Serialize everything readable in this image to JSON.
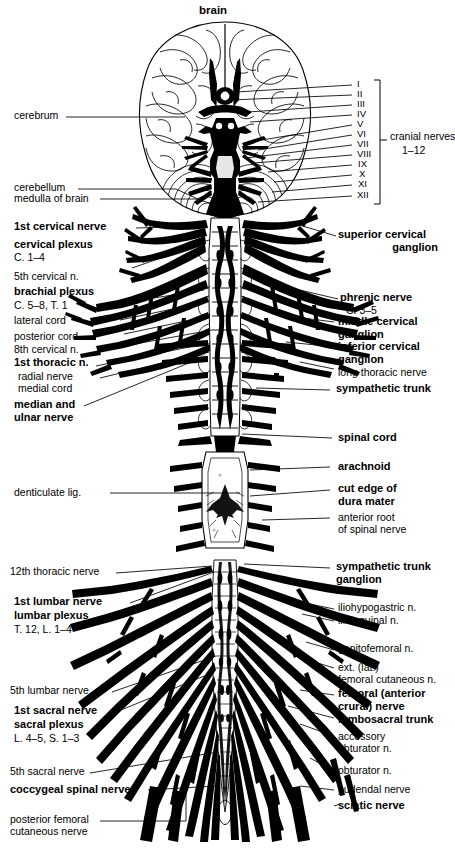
{
  "figure": {
    "title": "brain",
    "type": "anatomical-diagram",
    "cranial_nerve_bracket": {
      "label_line1": "cranial nerves",
      "label_line2": "1–12",
      "numerals": [
        "I",
        "II",
        "III",
        "IV",
        "V",
        "VI",
        "VII",
        "VIII",
        "IX",
        "X",
        "XI",
        "XII"
      ]
    }
  },
  "labels_left": [
    {
      "id": "cerebrum",
      "text": "cerebrum",
      "weight": "regular"
    },
    {
      "id": "cerebellum",
      "text": "cerebellum",
      "weight": "regular"
    },
    {
      "id": "medulla-of-brain",
      "text": "medulla of brain",
      "weight": "regular"
    },
    {
      "id": "first-cervical-nerve",
      "text": "1st cervical nerve",
      "weight": "bold"
    },
    {
      "id": "cervical-plexus",
      "text": "cervical plexus",
      "weight": "bold"
    },
    {
      "id": "cervical-plexus-roots",
      "text": "C. 1–4",
      "weight": "regular"
    },
    {
      "id": "fifth-cervical-n",
      "text": "5th cervical n.",
      "weight": "regular"
    },
    {
      "id": "brachial-plexus",
      "text": "brachial plexus",
      "weight": "bold"
    },
    {
      "id": "brachial-plexus-roots",
      "text": "C. 5–8, T. 1",
      "weight": "regular"
    },
    {
      "id": "lateral-cord",
      "text": "lateral cord",
      "weight": "regular"
    },
    {
      "id": "posterior-cord",
      "text": "posterior cord",
      "weight": "regular"
    },
    {
      "id": "eighth-cervical-n",
      "text": "8th cervical n.",
      "weight": "regular"
    },
    {
      "id": "first-thoracic-n",
      "text": "1st thoracic n.",
      "weight": "bold"
    },
    {
      "id": "radial-nerve",
      "text": "radial nerve",
      "weight": "regular"
    },
    {
      "id": "medial-cord",
      "text": "medial cord",
      "weight": "regular"
    },
    {
      "id": "median-and-ulnar-nerve-1",
      "text": "median and",
      "weight": "bold"
    },
    {
      "id": "median-and-ulnar-nerve-2",
      "text": "ulnar nerve",
      "weight": "bold"
    },
    {
      "id": "denticulate-lig",
      "text": "denticulate lig.",
      "weight": "regular"
    },
    {
      "id": "twelfth-thoracic-nerve",
      "text": "12th thoracic nerve",
      "weight": "regular"
    },
    {
      "id": "first-lumbar-nerve",
      "text": "1st lumbar nerve",
      "weight": "bold"
    },
    {
      "id": "lumbar-plexus",
      "text": "lumbar plexus",
      "weight": "bold"
    },
    {
      "id": "lumbar-plexus-roots",
      "text": "T. 12, L. 1–4",
      "weight": "regular"
    },
    {
      "id": "fifth-lumbar-nerve",
      "text": "5th lumbar nerve",
      "weight": "regular"
    },
    {
      "id": "first-sacral-nerve",
      "text": "1st sacral nerve",
      "weight": "bold"
    },
    {
      "id": "sacral-plexus",
      "text": "sacral plexus",
      "weight": "bold"
    },
    {
      "id": "sacral-plexus-roots",
      "text": "L. 4–5, S. 1–3",
      "weight": "regular"
    },
    {
      "id": "fifth-sacral-nerve",
      "text": "5th sacral nerve",
      "weight": "regular"
    },
    {
      "id": "coccygeal-spinal-nerve",
      "text": "coccygeal spinal nerve",
      "weight": "bold"
    },
    {
      "id": "posterior-femoral-cutaneous-nerve-1",
      "text": "posterior femoral",
      "weight": "regular"
    },
    {
      "id": "posterior-femoral-cutaneous-nerve-2",
      "text": "cutaneous nerve",
      "weight": "regular"
    }
  ],
  "labels_right": [
    {
      "id": "superior-cervical-ganglion-1",
      "text": "superior cervical",
      "weight": "bold"
    },
    {
      "id": "superior-cervical-ganglion-2",
      "text": "ganglion",
      "weight": "bold"
    },
    {
      "id": "phrenic-nerve",
      "text": "phrenic nerve",
      "weight": "bold"
    },
    {
      "id": "phrenic-nerve-roots",
      "text": "C. 3–5",
      "weight": "regular"
    },
    {
      "id": "middle-cervical-ganglion-1",
      "text": "middle cervical",
      "weight": "bold"
    },
    {
      "id": "middle-cervical-ganglion-2",
      "text": "ganglion",
      "weight": "bold"
    },
    {
      "id": "inferior-cervical-ganglion-1",
      "text": "inferior cervical",
      "weight": "bold"
    },
    {
      "id": "inferior-cervical-ganglion-2",
      "text": "ganglion",
      "weight": "bold"
    },
    {
      "id": "long-thoracic-nerve",
      "text": "long thoracic nerve",
      "weight": "regular"
    },
    {
      "id": "sympathetic-trunk",
      "text": "sympathetic trunk",
      "weight": "bold"
    },
    {
      "id": "spinal-cord",
      "text": "spinal cord",
      "weight": "bold"
    },
    {
      "id": "arachnoid",
      "text": "arachnoid",
      "weight": "bold"
    },
    {
      "id": "cut-edge-of-dura-mater-1",
      "text": "cut edge of",
      "weight": "bold"
    },
    {
      "id": "cut-edge-of-dura-mater-2",
      "text": "dura mater",
      "weight": "bold"
    },
    {
      "id": "anterior-root-of-spinal-nerve-1",
      "text": "anterior root",
      "weight": "regular"
    },
    {
      "id": "anterior-root-of-spinal-nerve-2",
      "text": "of spinal nerve",
      "weight": "regular"
    },
    {
      "id": "sympathetic-trunk-ganglion-1",
      "text": "sympathetic trunk",
      "weight": "bold"
    },
    {
      "id": "sympathetic-trunk-ganglion-2",
      "text": "ganglion",
      "weight": "bold"
    },
    {
      "id": "iliohypogastric-n",
      "text": "iliohypogastric n.",
      "weight": "regular"
    },
    {
      "id": "ilioinguinal-n",
      "text": "ilioinguinal n.",
      "weight": "regular"
    },
    {
      "id": "genitofemoral-n",
      "text": "genitofemoral n.",
      "weight": "regular"
    },
    {
      "id": "ext-lat-femoral-cutaneous-n-1",
      "text": "ext. (lat.)",
      "weight": "regular"
    },
    {
      "id": "ext-lat-femoral-cutaneous-n-2",
      "text": "femoral cutaneous n.",
      "weight": "regular"
    },
    {
      "id": "femoral-anterior-crural-nerve-1",
      "text": "femoral (anterior",
      "weight": "bold"
    },
    {
      "id": "femoral-anterior-crural-nerve-2",
      "text": "crural) nerve",
      "weight": "bold"
    },
    {
      "id": "lumbosacral-trunk",
      "text": "lumbosacral trunk",
      "weight": "bold"
    },
    {
      "id": "accessory-obturator-n-1",
      "text": "accessory",
      "weight": "regular"
    },
    {
      "id": "accessory-obturator-n-2",
      "text": "obturator n.",
      "weight": "regular"
    },
    {
      "id": "obturator-n",
      "text": "obturator n.",
      "weight": "regular"
    },
    {
      "id": "pudendal-nerve",
      "text": "pudendal nerve",
      "weight": "regular"
    },
    {
      "id": "sciatic-nerve",
      "text": "sciatic nerve",
      "weight": "bold"
    }
  ],
  "colors": {
    "ink": "#000000",
    "paper": "#ffffff",
    "leader": "#000000"
  }
}
